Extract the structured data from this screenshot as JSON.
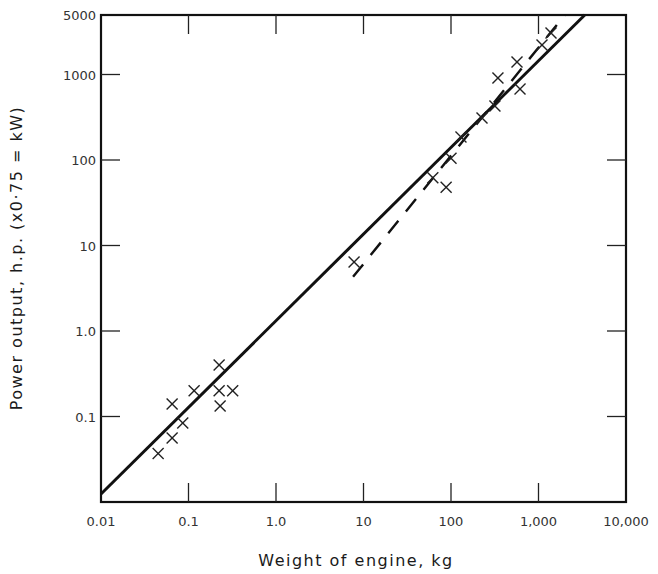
{
  "chart_data": {
    "type": "scatter",
    "title": "",
    "xlabel": "Weight of engine,  kg",
    "ylabel": "Power output,  h.p. (x0·75 = kW)",
    "xscale": "log",
    "yscale": "log",
    "xlim": [
      0.01,
      10000
    ],
    "ylim": [
      0.01,
      5000
    ],
    "grid": false,
    "legend": null,
    "x_ticks": [
      {
        "value": 0.01,
        "label": "0.01"
      },
      {
        "value": 0.1,
        "label": "0.1"
      },
      {
        "value": 1,
        "label": "1.0"
      },
      {
        "value": 10,
        "label": "10"
      },
      {
        "value": 100,
        "label": "100"
      },
      {
        "value": 1000,
        "label": "1,000"
      },
      {
        "value": 10000,
        "label": "10,000"
      }
    ],
    "y_ticks": [
      {
        "value": 0.1,
        "label": "0.1"
      },
      {
        "value": 1,
        "label": "1.0"
      },
      {
        "value": 10,
        "label": "10"
      },
      {
        "value": 100,
        "label": "100"
      },
      {
        "value": 1000,
        "label": "1000"
      },
      {
        "value": 5000,
        "label": "5000"
      }
    ],
    "series": [
      {
        "name": "Engines (data points)",
        "marker": "x",
        "points": [
          {
            "x": 0.045,
            "y": 0.037
          },
          {
            "x": 0.065,
            "y": 0.056
          },
          {
            "x": 0.086,
            "y": 0.084
          },
          {
            "x": 0.065,
            "y": 0.14
          },
          {
            "x": 0.116,
            "y": 0.2
          },
          {
            "x": 0.224,
            "y": 0.4
          },
          {
            "x": 0.224,
            "y": 0.2
          },
          {
            "x": 0.23,
            "y": 0.133
          },
          {
            "x": 0.32,
            "y": 0.2
          },
          {
            "x": 7.8,
            "y": 6.4
          },
          {
            "x": 62,
            "y": 62
          },
          {
            "x": 88,
            "y": 48
          },
          {
            "x": 100,
            "y": 105
          },
          {
            "x": 130,
            "y": 186
          },
          {
            "x": 226,
            "y": 310
          },
          {
            "x": 318,
            "y": 428
          },
          {
            "x": 344,
            "y": 910
          },
          {
            "x": 615,
            "y": 676
          },
          {
            "x": 568,
            "y": 1400
          },
          {
            "x": 1096,
            "y": 2210
          },
          {
            "x": 1390,
            "y": 3050
          }
        ]
      },
      {
        "name": "Overall fit (solid line)",
        "style": "solid",
        "points": [
          {
            "x": 0.01,
            "y": 0.0124
          },
          {
            "x": 3400,
            "y": 5000
          }
        ]
      },
      {
        "name": "Large-engine fit (dashed line)",
        "style": "dashed",
        "points": [
          {
            "x": 7.6,
            "y": 4.3
          },
          {
            "x": 2010,
            "y": 5000
          }
        ]
      }
    ]
  },
  "plot": {
    "left_px": 101,
    "right_px": 626,
    "top_px": 15,
    "bottom_px": 502,
    "x_decade_px": 87.5,
    "y_decade_px": 85.5
  }
}
